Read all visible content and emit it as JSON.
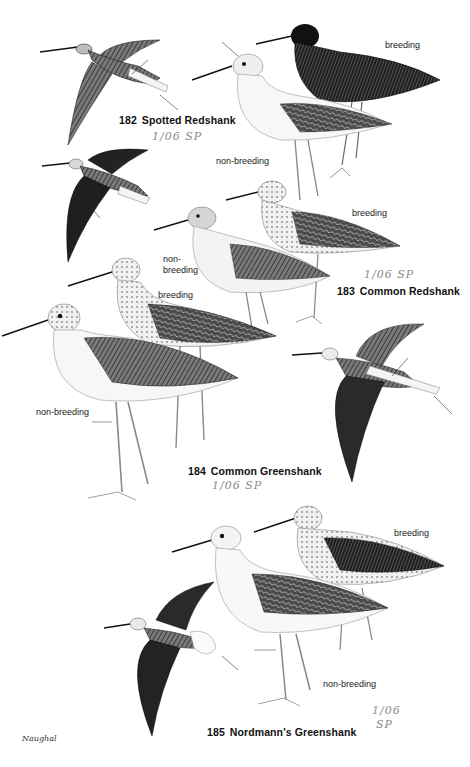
{
  "plate": {
    "species": [
      {
        "number": "182",
        "name": "Spotted Redshank",
        "annotation": "1/06 SP",
        "plumage_labels": [
          "breeding",
          "non-breeding"
        ]
      },
      {
        "number": "183",
        "name": "Common Redshank",
        "annotation": "1/06 SP",
        "plumage_labels": [
          "breeding",
          "non-breeding"
        ]
      },
      {
        "number": "184",
        "name": "Common Greenshank",
        "annotation": "1/06 SP",
        "plumage_labels": [
          "breeding",
          "non-breeding"
        ]
      },
      {
        "number": "185",
        "name": "Nordmann's Greenshank",
        "annotation": "1/06 SP",
        "plumage_labels": [
          "breeding",
          "non-breeding"
        ]
      }
    ],
    "labels": {
      "spotted_breeding": "breeding",
      "spotted_nonbreeding": "non-breeding",
      "common_red_breeding": "breeding",
      "common_red_nonbreeding_line1": "non-",
      "common_red_nonbreeding_line2": "breeding",
      "greenshank_breeding": "breeding",
      "greenshank_nonbreeding": "non-breeding",
      "nordmann_breeding": "breeding",
      "nordmann_nonbreeding": "non-breeding"
    },
    "annotations": {
      "a182": "1/06  SP",
      "a183": "1/06  SP",
      "a184": "1/06  SP",
      "a185_line1": "1/06",
      "a185_line2": "SP"
    },
    "artist_signature": "Naughal",
    "colors": {
      "background": "#ffffff",
      "ink": "#111111",
      "pencil": "#8a8a8a"
    }
  }
}
